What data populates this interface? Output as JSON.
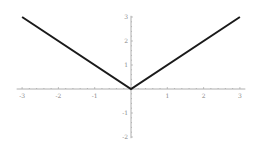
{
  "chart_data": {
    "type": "line",
    "title": "",
    "xlabel": "",
    "ylabel": "",
    "xlim": [
      -3,
      3
    ],
    "ylim": [
      -2,
      3
    ],
    "grid": false,
    "legend": null,
    "series": [
      {
        "name": "y = |x|",
        "color": "#1a1a1a",
        "x": [
          -3,
          0,
          3
        ],
        "y": [
          3,
          0,
          3
        ]
      }
    ],
    "x_ticks": [
      {
        "value": -3,
        "label": "-3"
      },
      {
        "value": -2,
        "label": "-2"
      },
      {
        "value": -1,
        "label": "-1"
      },
      {
        "value": 1,
        "label": "1"
      },
      {
        "value": 2,
        "label": "2"
      },
      {
        "value": 3,
        "label": "3"
      }
    ],
    "y_ticks": [
      {
        "value": 3,
        "label": "3"
      },
      {
        "value": 2,
        "label": "2"
      },
      {
        "value": 1,
        "label": "1"
      },
      {
        "value": -1,
        "label": "-1"
      },
      {
        "value": -2,
        "label": "-2"
      }
    ]
  },
  "colors": {
    "axis": "#9a9a9a",
    "line": "#1a1a1a",
    "label": "#8a8a8a"
  }
}
